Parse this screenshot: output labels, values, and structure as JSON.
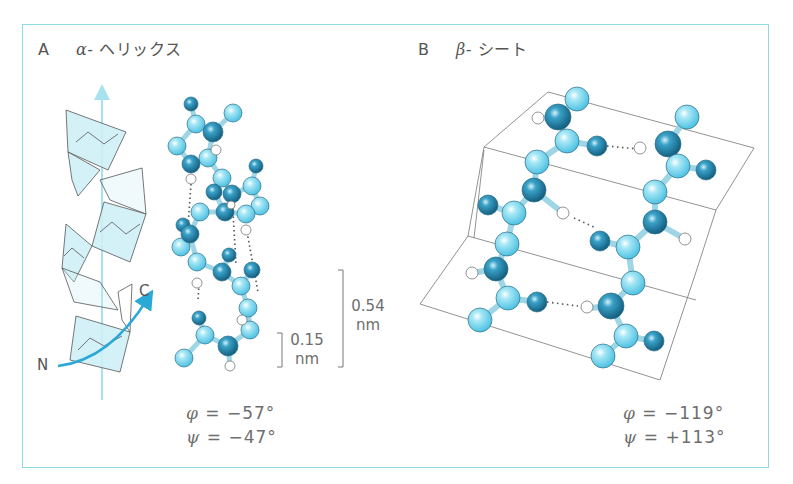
{
  "panels": {
    "a": {
      "letter": "A",
      "greek": "α",
      "title": "- ヘリックス",
      "phi_symbol": "φ",
      "phi_value": "= −57°",
      "psi_symbol": "ψ",
      "psi_value": "= −47°",
      "n_label": "N",
      "c_label": "C",
      "scale_small_value": "0.15",
      "scale_small_unit": "nm",
      "scale_large_value": "0.54",
      "scale_large_unit": "nm"
    },
    "b": {
      "letter": "B",
      "greek": "β",
      "title": "- シート",
      "phi_symbol": "φ",
      "phi_value": "= −119°",
      "psi_symbol": "ψ",
      "psi_value": "= +113°"
    }
  },
  "colors": {
    "frame": "#8fdbe3",
    "atom_light": "#6fd3ec",
    "atom_dark": "#1f86ad",
    "atom_hydrogen": "#ffffff",
    "axis_arrow": "#a6e3ef",
    "ribbon_fill": "#cdeff6",
    "direction_arrow": "#2aa9d6"
  }
}
